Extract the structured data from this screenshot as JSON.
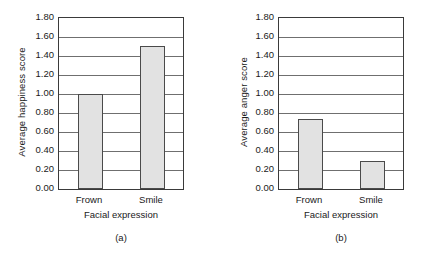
{
  "figure": {
    "background_color": "#ffffff",
    "bar_fill_color": "#e2e2e2",
    "bar_border_color": "#4a4a4a",
    "axis_color": "#3a3a3a",
    "gridline_color": "#6f6f6f"
  },
  "chart_data": [
    {
      "type": "bar",
      "panel_label": "(a)",
      "title": "",
      "xlabel": "Facial expression",
      "ylabel": "Average happiness score",
      "categories": [
        "Frown",
        "Smile"
      ],
      "values": [
        1.0,
        1.51
      ],
      "ylim": [
        0.0,
        1.8
      ],
      "ytick_labels": [
        "0.00",
        "0.20",
        "0.40",
        "0.60",
        "0.80",
        "1.00",
        "1.20",
        "1.40",
        "1.60",
        "1.80"
      ],
      "ytick_values": [
        0.0,
        0.2,
        0.4,
        0.6,
        0.8,
        1.0,
        1.2,
        1.4,
        1.6,
        1.8
      ],
      "grid": true,
      "grid_axis": "y",
      "legend": null,
      "series": [
        {
          "name": "Average happiness score",
          "values": [
            1.0,
            1.51
          ]
        }
      ]
    },
    {
      "type": "bar",
      "panel_label": "(b)",
      "title": "",
      "xlabel": "Facial expression",
      "ylabel": "Average anger score",
      "categories": [
        "Frown",
        "Smile"
      ],
      "values": [
        0.74,
        0.3
      ],
      "ylim": [
        0.0,
        1.8
      ],
      "ytick_labels": [
        "0.00",
        "0.20",
        "0.40",
        "0.60",
        "0.80",
        "1.00",
        "1.20",
        "1.40",
        "1.60",
        "1.80"
      ],
      "ytick_values": [
        0.0,
        0.2,
        0.4,
        0.6,
        0.8,
        1.0,
        1.2,
        1.4,
        1.6,
        1.8
      ],
      "grid": true,
      "grid_axis": "y",
      "legend": null,
      "series": [
        {
          "name": "Average anger score",
          "values": [
            0.74,
            0.3
          ]
        }
      ]
    }
  ]
}
